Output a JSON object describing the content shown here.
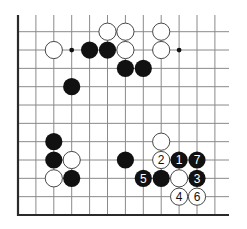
{
  "diagram": {
    "type": "go-board-fragment",
    "grid": {
      "columns": 12,
      "rows": 11,
      "origin_x": 18,
      "origin_y": 31.7,
      "col_spacing": 17.9,
      "row_spacing": 18.33,
      "line_color": "#8a8a8a",
      "edge_color": "#2a2a2a",
      "left_edge": true,
      "bottom_edge": true,
      "top_extent_y": 15,
      "right_extent_x": 229
    },
    "star_points": [
      {
        "col": 3,
        "row": 1
      },
      {
        "col": 9,
        "row": 1
      }
    ],
    "stones": [
      {
        "col": 5,
        "row": 0,
        "color": "white",
        "label": ""
      },
      {
        "col": 6,
        "row": 0,
        "color": "white",
        "label": ""
      },
      {
        "col": 8,
        "row": 0,
        "color": "white",
        "label": ""
      },
      {
        "col": 2,
        "row": 1,
        "color": "white",
        "label": ""
      },
      {
        "col": 4,
        "row": 1,
        "color": "black",
        "label": ""
      },
      {
        "col": 5,
        "row": 1,
        "color": "black",
        "label": ""
      },
      {
        "col": 6,
        "row": 1,
        "color": "white",
        "label": ""
      },
      {
        "col": 8,
        "row": 1,
        "color": "white",
        "label": ""
      },
      {
        "col": 6,
        "row": 2,
        "color": "black",
        "label": ""
      },
      {
        "col": 7,
        "row": 2,
        "color": "black",
        "label": ""
      },
      {
        "col": 3,
        "row": 3,
        "color": "black",
        "label": ""
      },
      {
        "col": 2,
        "row": 6,
        "color": "black",
        "label": ""
      },
      {
        "col": 8,
        "row": 6,
        "color": "white",
        "label": ""
      },
      {
        "col": 2,
        "row": 7,
        "color": "black",
        "label": ""
      },
      {
        "col": 3,
        "row": 7,
        "color": "white",
        "label": ""
      },
      {
        "col": 6,
        "row": 7,
        "color": "black",
        "label": ""
      },
      {
        "col": 8,
        "row": 7,
        "color": "white",
        "label": "2"
      },
      {
        "col": 9,
        "row": 7,
        "color": "black",
        "label": "1"
      },
      {
        "col": 10,
        "row": 7,
        "color": "black",
        "label": "7"
      },
      {
        "col": 2,
        "row": 8,
        "color": "white",
        "label": ""
      },
      {
        "col": 3,
        "row": 8,
        "color": "black",
        "label": ""
      },
      {
        "col": 7,
        "row": 8,
        "color": "black",
        "label": "5"
      },
      {
        "col": 8,
        "row": 8,
        "color": "black",
        "label": ""
      },
      {
        "col": 9,
        "row": 8,
        "color": "white",
        "label": ""
      },
      {
        "col": 10,
        "row": 8,
        "color": "black",
        "label": "3"
      },
      {
        "col": 9,
        "row": 9,
        "color": "white",
        "label": "4"
      },
      {
        "col": 10,
        "row": 9,
        "color": "white",
        "label": "6"
      }
    ],
    "stone_radius": 8.6,
    "colors": {
      "black_stone": "#111111",
      "white_stone": "#ffffff",
      "white_stone_stroke": "#333333",
      "label_on_black": "#ffffff",
      "label_on_white": "#111111",
      "background": "#ffffff"
    }
  }
}
